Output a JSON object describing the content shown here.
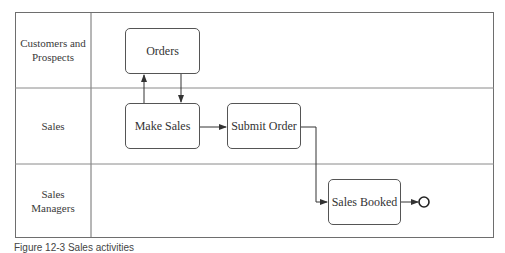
{
  "diagram": {
    "type": "swimlane-process",
    "lanes": [
      {
        "label": "Customers and Prospects"
      },
      {
        "label": "Sales"
      },
      {
        "label": "Sales Managers"
      }
    ],
    "tasks": [
      {
        "id": "orders",
        "label": "Orders",
        "lane": 0
      },
      {
        "id": "make_sales",
        "label": "Make Sales",
        "lane": 1
      },
      {
        "id": "submit_order",
        "label": "Submit Order",
        "lane": 1
      },
      {
        "id": "sales_booked",
        "label": "Sales Booked",
        "lane": 2
      }
    ],
    "flows": [
      {
        "from": "make_sales",
        "to": "orders"
      },
      {
        "from": "orders",
        "to": "make_sales"
      },
      {
        "from": "make_sales",
        "to": "submit_order"
      },
      {
        "from": "submit_order",
        "to": "sales_booked"
      },
      {
        "from": "sales_booked",
        "to": "end_event"
      }
    ],
    "end_event": {
      "shape": "circle"
    }
  },
  "caption": "Figure 12-3 Sales activities"
}
